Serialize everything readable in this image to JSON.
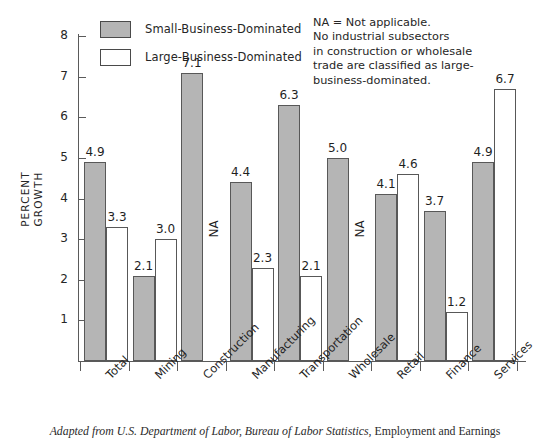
{
  "chart_data": {
    "type": "bar",
    "title": "",
    "xlabel": "",
    "ylabel": "PERCENT GROWTH",
    "ylim": [
      0,
      8
    ],
    "yticks": [
      1,
      2,
      3,
      4,
      5,
      6,
      7,
      8
    ],
    "grid": false,
    "legend_position": "top-center",
    "categories": [
      "Total",
      "Mining",
      "Construction",
      "Manufacturing",
      "Transportation",
      "Wholesale",
      "Retail",
      "Finance",
      "Services"
    ],
    "series": [
      {
        "name": "Small-Business-Dominated",
        "color": "#b5b5b5",
        "values": [
          4.9,
          2.1,
          7.1,
          4.4,
          6.3,
          5.0,
          4.1,
          3.7,
          4.9
        ],
        "labels": [
          "4.9",
          "2.1",
          "7.1",
          "4.4",
          "6.3",
          "5.0",
          "4.1",
          "3.7",
          "4.9"
        ]
      },
      {
        "name": "Large-Business-Dominated",
        "color": "#ffffff",
        "values": [
          3.3,
          3.0,
          null,
          2.3,
          2.1,
          null,
          4.6,
          1.2,
          6.7
        ],
        "labels": [
          "3.3",
          "3.0",
          "NA",
          "2.3",
          "2.1",
          "NA",
          "4.6",
          "1.2",
          "6.7"
        ]
      }
    ],
    "annotations": [
      "NA = Not applicable.",
      "No industrial subsectors",
      "in construction or wholesale",
      "trade are classified as large-",
      "business-dominated."
    ]
  },
  "legend": {
    "items": [
      {
        "label": "Small-Business-Dominated",
        "swatch": "small"
      },
      {
        "label": "Large-Business-Dominated",
        "swatch": "large"
      }
    ]
  },
  "yaxis": {
    "ticks": [
      "1",
      "2",
      "3",
      "4",
      "5",
      "6",
      "7",
      "8"
    ],
    "title_line1": "PERCENT",
    "title_line2": "GROWTH"
  },
  "note": {
    "line1": "NA = Not applicable.",
    "line2": "No industrial subsectors",
    "line3": "in construction or wholesale",
    "line4": "trade are classified as large-",
    "line5": "business-dominated."
  },
  "caption": {
    "italic_part": "Adapted from U.S. Department of Labor, Bureau of Labor Statistics,",
    "roman_part": " Employment and Earnings"
  }
}
